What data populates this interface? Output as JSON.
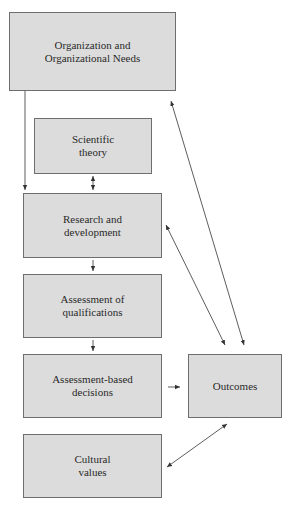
{
  "diagram": {
    "boxes": [
      {
        "id": "org",
        "label": "Organization and\nOrganizational Needs"
      },
      {
        "id": "sci",
        "label": "Scientific\ntheory"
      },
      {
        "id": "rnd",
        "label": "Research and\ndevelopment"
      },
      {
        "id": "aoq",
        "label": "Assessment of\nqualifications"
      },
      {
        "id": "abd",
        "label": "Assessment-based\ndecisions"
      },
      {
        "id": "out",
        "label": "Outcomes"
      },
      {
        "id": "cul",
        "label": "Cultural\nvalues"
      }
    ],
    "edges": [
      {
        "from": "org",
        "to": "rnd",
        "type": "one-way"
      },
      {
        "from": "sci",
        "to": "rnd",
        "type": "two-way"
      },
      {
        "from": "rnd",
        "to": "aoq",
        "type": "one-way"
      },
      {
        "from": "aoq",
        "to": "abd",
        "type": "one-way"
      },
      {
        "from": "abd",
        "to": "out",
        "type": "one-way"
      },
      {
        "from": "out",
        "to": "org",
        "type": "two-way"
      },
      {
        "from": "out",
        "to": "rnd",
        "type": "two-way"
      },
      {
        "from": "out",
        "to": "cul",
        "type": "two-way"
      }
    ],
    "colors": {
      "box_fill": "#dcdcdc",
      "box_border": "#6e6e6e",
      "line": "#333333"
    }
  }
}
